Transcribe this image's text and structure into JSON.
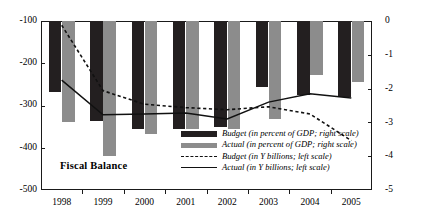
{
  "chart_data": {
    "type": "bar",
    "title": "Fiscal Balance",
    "xlabel": "",
    "ylabel": "",
    "categories": [
      "1998",
      "1999",
      "2000",
      "2001",
      "2002",
      "2003",
      "2004",
      "2005"
    ],
    "left_axis": {
      "label": "in Y billions",
      "ticks": [
        "-100",
        "-200",
        "-300",
        "-400",
        "-500"
      ],
      "tickvalues": [
        -100,
        -200,
        -300,
        -400,
        -500
      ],
      "ylim": [
        -500,
        -100
      ]
    },
    "right_axis": {
      "label": "in percent of GDP",
      "ticks": [
        "0",
        "-1",
        "-2",
        "-3",
        "-4",
        "-5"
      ],
      "tickvalues": [
        0,
        -1,
        -2,
        -3,
        -4,
        -5
      ],
      "ylim": [
        -5,
        0
      ]
    },
    "grid": false,
    "legend_position": "inside-lower-right",
    "series": [
      {
        "name": "Budget (in percent of GDP; right scale)",
        "kind": "bar",
        "axis": "right",
        "color": "#231f20",
        "values": [
          -2.1,
          -2.95,
          -3.2,
          -3.2,
          -3.15,
          -1.95,
          -2.2,
          -2.25
        ]
      },
      {
        "name": "Actual (in percent of GDP; right scale)",
        "kind": "bar",
        "axis": "right",
        "color": "#8c8c8c",
        "values": [
          -3.0,
          -4.0,
          -3.35,
          -3.2,
          -3.2,
          -2.9,
          -1.6,
          -1.8
        ]
      },
      {
        "name": "Budget (in Y billions; left scale)",
        "kind": "dashed-line",
        "axis": "left",
        "color": "#111111",
        "values": [
          -110,
          -265,
          -297,
          -305,
          -310,
          -303,
          -320,
          -383
        ]
      },
      {
        "name": "Actual (in Y billions; left scale)",
        "kind": "solid-line",
        "axis": "left",
        "color": "#111111",
        "values": [
          -240,
          -322,
          -320,
          -318,
          -332,
          -292,
          -272,
          -282
        ]
      }
    ]
  },
  "legend": {
    "items": [
      {
        "key": "solid-dark-bar",
        "label": "Budget (in percent of GDP; right scale)"
      },
      {
        "key": "gray-bar",
        "label": "Actual (in percent of GDP; right scale)"
      },
      {
        "key": "dashed-line",
        "label": "Budget (in Y billions; left scale)"
      },
      {
        "key": "solid-line",
        "label": "Actual (in Y billions; left scale)"
      }
    ]
  }
}
